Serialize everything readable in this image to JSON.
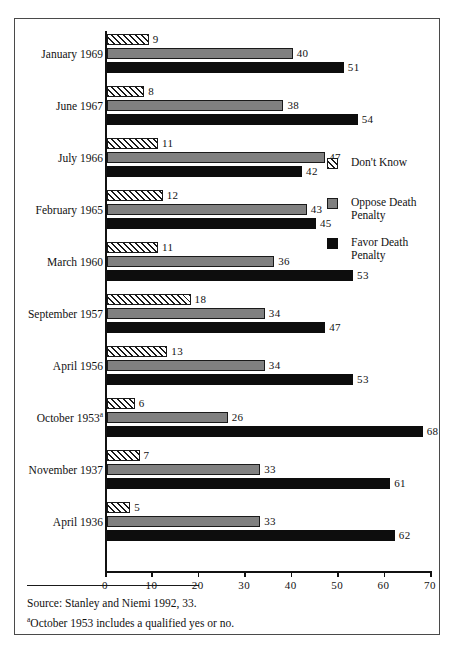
{
  "chart_data": {
    "type": "bar",
    "orientation": "horizontal",
    "title": "",
    "xlabel": "",
    "ylabel": "",
    "xlim": [
      0,
      70
    ],
    "xticks": [
      0,
      10,
      20,
      30,
      40,
      50,
      60,
      70
    ],
    "xtick_labels": [
      "0",
      "10",
      "20",
      "30",
      "40",
      "50",
      "60",
      "70"
    ],
    "grid": false,
    "legend_position": "right-middle",
    "categories": [
      "January 1969",
      "June 1967",
      "July 1966",
      "February 1965",
      "March 1960",
      "September 1957",
      "April 1956",
      "October 1953",
      "November 1937",
      "April 1936"
    ],
    "category_footnote_markers": [
      "",
      "",
      "",
      "",
      "",
      "",
      "",
      "a",
      "",
      ""
    ],
    "series": [
      {
        "name": "Don't Know",
        "color": "#ffffff",
        "pattern": "diagonal-hatch",
        "values": [
          9,
          8,
          11,
          12,
          11,
          18,
          13,
          6,
          7,
          5
        ]
      },
      {
        "name": "Oppose Death Penalty",
        "color": "#808080",
        "pattern": "solid",
        "values": [
          40,
          38,
          47,
          43,
          36,
          34,
          34,
          26,
          33,
          33
        ]
      },
      {
        "name": "Favor Death Penalty",
        "color": "#0d0d0d",
        "pattern": "solid",
        "values": [
          51,
          54,
          42,
          45,
          53,
          47,
          53,
          68,
          61,
          62
        ]
      }
    ]
  },
  "legend": {
    "items": [
      {
        "label": "Don't Know",
        "swatch": "dont-know-swatch"
      },
      {
        "label": "Oppose Death\nPenalty",
        "swatch": "oppose-swatch"
      },
      {
        "label": "Favor Death\nPenalty",
        "swatch": "favor-swatch"
      }
    ]
  },
  "notes": {
    "source": "Source: Stanley and Niemi 1992, 33.",
    "footnote_marker": "a",
    "footnote": "October 1953 includes a qualified yes or no."
  }
}
